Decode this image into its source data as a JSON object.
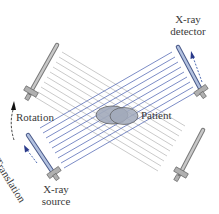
{
  "labels": {
    "detector_line1": "X-ray",
    "detector_line2": "detector",
    "source_line1": "X-ray",
    "source_line2": "source",
    "rotation": "Rotation",
    "translation": "Translation",
    "patient": "Patient"
  },
  "colors": {
    "blue_beam": "#5a6fb8",
    "gray_beam": "#b8b8b8",
    "bar_gray": "#a8a8a8",
    "bar_blue": "#a9b9d9",
    "patient_fill": "#9aa3b8",
    "text": "#3a3a3a"
  }
}
